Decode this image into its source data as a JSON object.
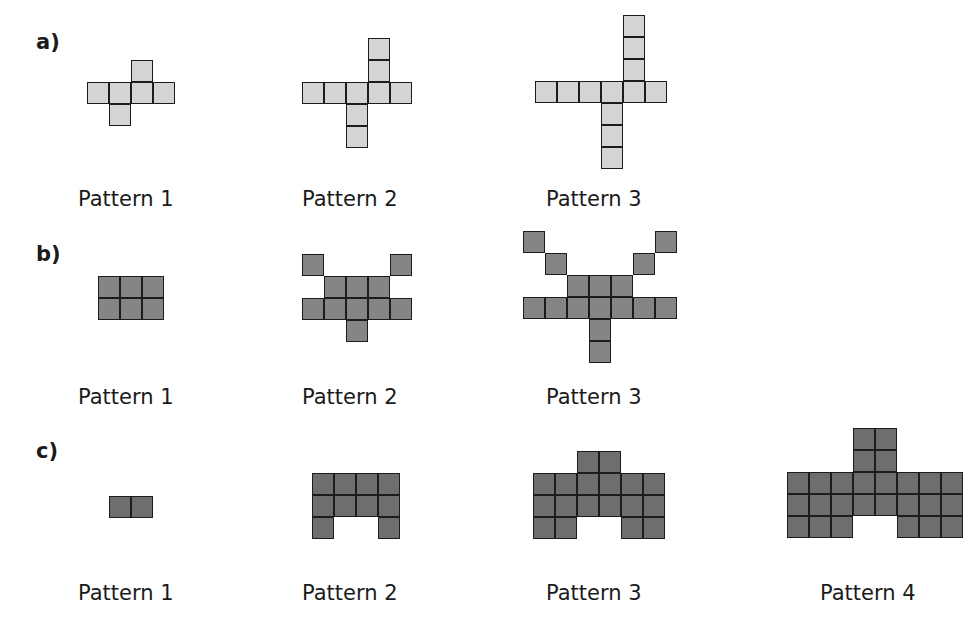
{
  "cell_size": 22,
  "colors": {
    "a": "#d4d4d4",
    "b": "#858585",
    "c": "#6e6e6e"
  },
  "sections": [
    {
      "label": "a)",
      "label_pos": [
        36,
        32
      ],
      "patterns": [
        {
          "label": "Pattern 1",
          "label_pos": [
            78,
            189
          ],
          "origin": [
            87,
            60
          ],
          "cells": [
            [
              2,
              0
            ],
            [
              0,
              1
            ],
            [
              1,
              1
            ],
            [
              2,
              1
            ],
            [
              3,
              1
            ],
            [
              1,
              2
            ]
          ]
        },
        {
          "label": "Pattern 2",
          "label_pos": [
            302,
            189
          ],
          "origin": [
            302,
            38
          ],
          "cells": [
            [
              3,
              0
            ],
            [
              3,
              1
            ],
            [
              0,
              2
            ],
            [
              1,
              2
            ],
            [
              2,
              2
            ],
            [
              3,
              2
            ],
            [
              4,
              2
            ],
            [
              2,
              3
            ],
            [
              2,
              4
            ]
          ]
        },
        {
          "label": "Pattern 3",
          "label_pos": [
            546,
            189
          ],
          "origin": [
            535,
            15
          ],
          "cells": [
            [
              4,
              0
            ],
            [
              4,
              1
            ],
            [
              4,
              2
            ],
            [
              0,
              3
            ],
            [
              1,
              3
            ],
            [
              2,
              3
            ],
            [
              3,
              3
            ],
            [
              4,
              3
            ],
            [
              5,
              3
            ],
            [
              3,
              4
            ],
            [
              3,
              5
            ],
            [
              3,
              6
            ]
          ]
        }
      ]
    },
    {
      "label": "b)",
      "label_pos": [
        36,
        244
      ],
      "patterns": [
        {
          "label": "Pattern 1",
          "label_pos": [
            78,
            387
          ],
          "origin": [
            98,
            276
          ],
          "cells": [
            [
              0,
              0
            ],
            [
              1,
              0
            ],
            [
              2,
              0
            ],
            [
              0,
              1
            ],
            [
              1,
              1
            ],
            [
              2,
              1
            ]
          ]
        },
        {
          "label": "Pattern 2",
          "label_pos": [
            302,
            387
          ],
          "origin": [
            302,
            254
          ],
          "cells": [
            [
              0,
              0
            ],
            [
              4,
              0
            ],
            [
              1,
              1
            ],
            [
              2,
              1
            ],
            [
              3,
              1
            ],
            [
              0,
              2
            ],
            [
              1,
              2
            ],
            [
              2,
              2
            ],
            [
              3,
              2
            ],
            [
              4,
              2
            ],
            [
              2,
              3
            ]
          ]
        },
        {
          "label": "Pattern 3",
          "label_pos": [
            546,
            387
          ],
          "origin": [
            523,
            231
          ],
          "cells": [
            [
              0,
              0
            ],
            [
              6,
              0
            ],
            [
              1,
              1
            ],
            [
              5,
              1
            ],
            [
              2,
              2
            ],
            [
              3,
              2
            ],
            [
              4,
              2
            ],
            [
              0,
              3
            ],
            [
              1,
              3
            ],
            [
              2,
              3
            ],
            [
              3,
              3
            ],
            [
              4,
              3
            ],
            [
              5,
              3
            ],
            [
              6,
              3
            ],
            [
              3,
              4
            ],
            [
              3,
              5
            ]
          ]
        }
      ]
    },
    {
      "label": "c)",
      "label_pos": [
        36,
        441
      ],
      "patterns": [
        {
          "label": "Pattern 1",
          "label_pos": [
            78,
            583
          ],
          "origin": [
            109,
            496
          ],
          "cells": [
            [
              0,
              0
            ],
            [
              1,
              0
            ]
          ]
        },
        {
          "label": "Pattern 2",
          "label_pos": [
            302,
            583
          ],
          "origin": [
            312,
            473
          ],
          "cells": [
            [
              0,
              0
            ],
            [
              1,
              0
            ],
            [
              2,
              0
            ],
            [
              3,
              0
            ],
            [
              0,
              1
            ],
            [
              1,
              1
            ],
            [
              2,
              1
            ],
            [
              3,
              1
            ],
            [
              0,
              2
            ],
            [
              3,
              2
            ]
          ]
        },
        {
          "label": "Pattern 3",
          "label_pos": [
            546,
            583
          ],
          "origin": [
            533,
            451
          ],
          "cells": [
            [
              2,
              0
            ],
            [
              3,
              0
            ],
            [
              0,
              1
            ],
            [
              1,
              1
            ],
            [
              2,
              1
            ],
            [
              3,
              1
            ],
            [
              4,
              1
            ],
            [
              5,
              1
            ],
            [
              0,
              2
            ],
            [
              1,
              2
            ],
            [
              2,
              2
            ],
            [
              3,
              2
            ],
            [
              4,
              2
            ],
            [
              5,
              2
            ],
            [
              0,
              3
            ],
            [
              1,
              3
            ],
            [
              4,
              3
            ],
            [
              5,
              3
            ]
          ]
        },
        {
          "label": "Pattern 4",
          "label_pos": [
            820,
            583
          ],
          "origin": [
            787,
            428
          ],
          "cells": [
            [
              3,
              0
            ],
            [
              4,
              0
            ],
            [
              3,
              1
            ],
            [
              4,
              1
            ],
            [
              0,
              2
            ],
            [
              1,
              2
            ],
            [
              2,
              2
            ],
            [
              3,
              2
            ],
            [
              4,
              2
            ],
            [
              5,
              2
            ],
            [
              6,
              2
            ],
            [
              7,
              2
            ],
            [
              0,
              3
            ],
            [
              1,
              3
            ],
            [
              2,
              3
            ],
            [
              3,
              3
            ],
            [
              4,
              3
            ],
            [
              5,
              3
            ],
            [
              6,
              3
            ],
            [
              7,
              3
            ],
            [
              0,
              4
            ],
            [
              1,
              4
            ],
            [
              2,
              4
            ],
            [
              5,
              4
            ],
            [
              6,
              4
            ],
            [
              7,
              4
            ]
          ]
        }
      ]
    }
  ]
}
